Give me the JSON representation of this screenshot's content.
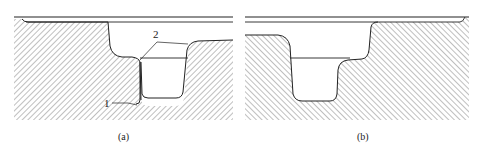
{
  "figure": {
    "type": "cross-section diagram",
    "panels": [
      {
        "id": "a",
        "caption": "(a)",
        "hatch_direction": "backslash",
        "callouts": [
          {
            "label": "2",
            "note": "two leader lines to shoulders of the groove"
          },
          {
            "label": "1",
            "note": "leader line to lower left corner of the step"
          }
        ]
      },
      {
        "id": "b",
        "caption": "(b)",
        "hatch_direction": "slash",
        "callouts": []
      }
    ],
    "colors": {
      "line": "#222222",
      "hatch": "#8a8a8a",
      "background": "#ffffff"
    }
  }
}
